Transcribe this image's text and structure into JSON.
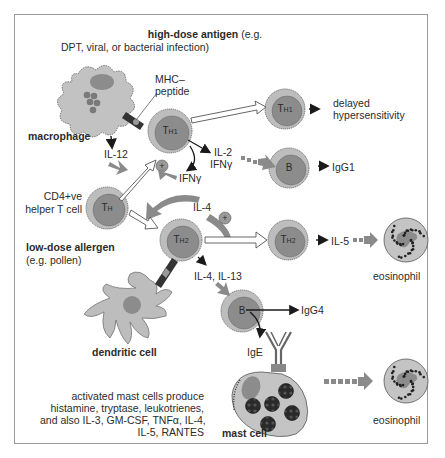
{
  "title": {
    "bold": "high-dose antigen",
    "rest": " (e.g.",
    "line2": "DPT, viral, or bacterial infection)"
  },
  "cells": {
    "macrophage": "macrophage",
    "mhc_line1": "MHC–",
    "mhc_line2": "peptide",
    "th1": {
      "main": "T",
      "sub": "H1"
    },
    "th1_right": {
      "main": "T",
      "sub": "H1"
    },
    "th": {
      "main": "T",
      "sub": "H"
    },
    "th2": {
      "main": "T",
      "sub": "H2"
    },
    "th2_right": {
      "main": "T",
      "sub": "H2"
    },
    "b_top": "B",
    "b_bottom": "B",
    "helper_line1": "CD4+ve",
    "helper_line2": "helper T cell",
    "low_dose_bold": "low-dose allergen",
    "low_dose_line2": "(e.g. pollen)",
    "dendritic": "dendritic cell",
    "mast": "mast cell",
    "eosinophil_1": "eosinophil",
    "eosinophil_2": "eosinophil"
  },
  "labels": {
    "il12": "IL-12",
    "plus1": "+",
    "ifng": "IFNγ",
    "il2": "IL-2",
    "ifng2": "IFNγ",
    "il4": "IL-4",
    "plus2": "+",
    "il4_il13": "IL-4, IL-13",
    "il5": "IL-5",
    "ige": "IgE",
    "igg1": "IgG1",
    "igg4": "IgG4",
    "delayed_line1": "delayed",
    "delayed_line2": "hypersensitivity"
  },
  "mast_text": [
    "activated mast cells produce",
    "histamine, tryptase, leukotrienes,",
    "and also IL-3, GM-CSF, TNFα, IL-4,",
    "IL-5, RANTES"
  ],
  "colors": {
    "cell_fill": "#8c8c8c",
    "cell_ring": "#bdbdbd",
    "body_fill": "#c4c4c4",
    "dark": "#222222",
    "arrow_gray": "#8a8a8a"
  }
}
